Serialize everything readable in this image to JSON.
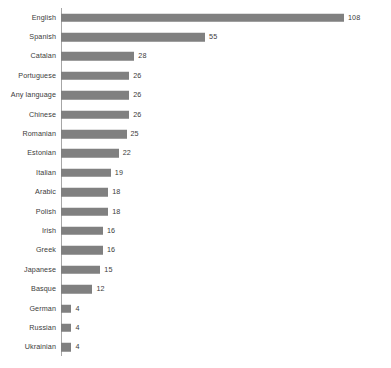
{
  "chart_data": {
    "type": "bar",
    "orientation": "horizontal",
    "title": "",
    "subtitle": "",
    "xlabel": "",
    "ylabel": "",
    "grid": false,
    "legend": false,
    "legend_position": "none",
    "axis_line": "vertical-category-axis-at-left",
    "show_value_labels": true,
    "xlim": [
      0,
      108
    ],
    "bar_color": "#808080",
    "axis_color": "#a6a6a6",
    "text_color": "#3b3b3b",
    "background_color": "#ffffff",
    "categories": [
      "English",
      "Spanish",
      "Catalan",
      "Portuguese",
      "Any language",
      "Chinese",
      "Romanian",
      "Estonian",
      "Italian",
      "Arabic",
      "Polish",
      "Irish",
      "Greek",
      "Japanese",
      "Basque",
      "German",
      "Russian",
      "Ukrainian"
    ],
    "values": [
      108,
      55,
      28,
      26,
      26,
      26,
      25,
      22,
      19,
      18,
      18,
      16,
      16,
      15,
      12,
      4,
      4,
      4
    ],
    "value_labels": [
      "108",
      "55",
      "28",
      "26",
      "26",
      "26",
      "25",
      "22",
      "19",
      "18",
      "18",
      "16",
      "16",
      "15",
      "12",
      "4",
      "4",
      "4"
    ]
  }
}
